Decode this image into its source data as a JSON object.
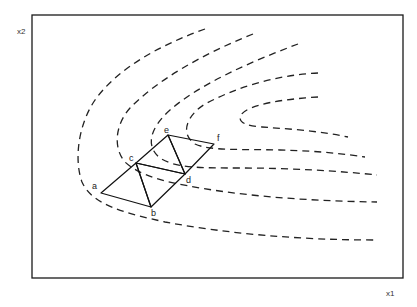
{
  "diagram": {
    "type": "simplex-search-on-contour-plot",
    "axes": {
      "x_label": "x1",
      "y_label": "x2"
    },
    "vertices": [
      {
        "id": "a",
        "label": "a"
      },
      {
        "id": "b",
        "label": "b"
      },
      {
        "id": "c",
        "label": "c"
      },
      {
        "id": "d",
        "label": "d"
      },
      {
        "id": "e",
        "label": "e"
      },
      {
        "id": "f",
        "label": "f"
      }
    ],
    "simplices": [
      [
        "a",
        "b",
        "c"
      ],
      [
        "b",
        "c",
        "d"
      ],
      [
        "c",
        "d",
        "e"
      ],
      [
        "d",
        "e",
        "f"
      ]
    ],
    "contours": {
      "count": 5,
      "style": "dashed"
    },
    "colors": {
      "line": "#111111",
      "background": "#ffffff"
    }
  }
}
